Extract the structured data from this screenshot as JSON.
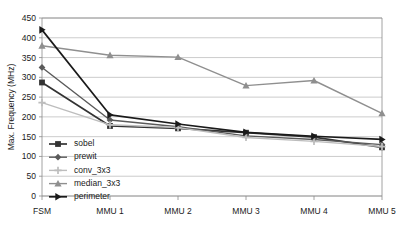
{
  "chart_data": {
    "type": "line",
    "title": "",
    "xlabel": "",
    "ylabel": "Max. Frequency (MHz)",
    "categories": [
      "FSM",
      "MMU 1",
      "MMU 2",
      "MMU 3",
      "MMU 4",
      "MMU 5"
    ],
    "ylim": [
      0,
      450
    ],
    "ytick_step": 50,
    "yticks": [
      0,
      50,
      100,
      150,
      200,
      250,
      300,
      350,
      400,
      450
    ],
    "ytick_labels": [
      "0",
      "50",
      "100",
      "150",
      "200",
      "250",
      "300",
      "350",
      "400",
      "450"
    ],
    "grid": "horizontal",
    "legend_position": "inside-lower-left",
    "series": [
      {
        "name": "sobel",
        "marker": "square",
        "color": "#333333",
        "values": [
          287,
          177,
          171,
          160,
          149,
          123
        ]
      },
      {
        "name": "prewit",
        "marker": "diamond",
        "color": "#5a5a5a",
        "values": [
          325,
          192,
          175,
          152,
          143,
          130
        ]
      },
      {
        "name": "conv_3x3",
        "marker": "plus",
        "color": "#bdbdbd",
        "values": [
          236,
          180,
          173,
          148,
          138,
          125
        ]
      },
      {
        "name": "median_3x3",
        "marker": "triangle",
        "color": "#8f8f8f",
        "values": [
          380,
          356,
          351,
          279,
          292,
          209
        ]
      },
      {
        "name": "perimeter",
        "marker": "right-triangle",
        "color": "#1a1a1a",
        "values": [
          420,
          205,
          182,
          161,
          151,
          143
        ]
      }
    ]
  },
  "legend": {
    "items": [
      {
        "label": "sobel"
      },
      {
        "label": "prewit"
      },
      {
        "label": "conv_3x3"
      },
      {
        "label": "median_3x3"
      },
      {
        "label": "perimeter"
      }
    ]
  }
}
